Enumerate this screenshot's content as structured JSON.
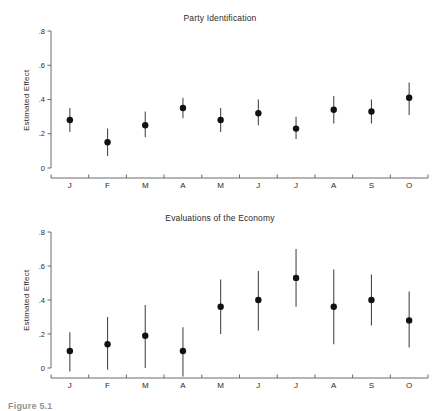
{
  "figure": {
    "caption": "Figure 5.1",
    "background": "#ffffff",
    "point_color": "#111111",
    "axis_color": "#5a5a5a"
  },
  "chart_data": [
    {
      "type": "scatter",
      "title": "Party Identification",
      "xlabel": "",
      "ylabel": "Estimated Effect",
      "categories": [
        "J",
        "F",
        "M",
        "A",
        "M",
        "J",
        "J",
        "A",
        "S",
        "O"
      ],
      "values": [
        0.28,
        0.15,
        0.25,
        0.35,
        0.28,
        0.32,
        0.23,
        0.34,
        0.33,
        0.41
      ],
      "ci_lower": [
        0.21,
        0.07,
        0.18,
        0.29,
        0.21,
        0.25,
        0.17,
        0.26,
        0.26,
        0.31
      ],
      "ci_upper": [
        0.35,
        0.23,
        0.33,
        0.41,
        0.35,
        0.4,
        0.3,
        0.42,
        0.4,
        0.5
      ],
      "ylim": [
        0,
        0.8
      ],
      "yticks": [
        0,
        0.2,
        0.4,
        0.6,
        0.8
      ],
      "ytick_labels": [
        "0",
        ".2",
        ".4",
        ".6",
        ".8"
      ],
      "grid": false,
      "legend": "none"
    },
    {
      "type": "scatter",
      "title": "Evaluations of the Economy",
      "xlabel": "",
      "ylabel": "Estimated Effect",
      "categories": [
        "J",
        "F",
        "M",
        "A",
        "M",
        "J",
        "J",
        "A",
        "S",
        "O"
      ],
      "values": [
        0.1,
        0.14,
        0.19,
        0.1,
        0.36,
        0.4,
        0.53,
        0.36,
        0.4,
        0.28
      ],
      "ci_lower": [
        -0.02,
        -0.01,
        0.0,
        -0.05,
        0.2,
        0.22,
        0.36,
        0.14,
        0.25,
        0.12
      ],
      "ci_upper": [
        0.21,
        0.3,
        0.37,
        0.24,
        0.52,
        0.57,
        0.7,
        0.58,
        0.55,
        0.45
      ],
      "ylim": [
        0,
        0.8
      ],
      "yticks": [
        0,
        0.2,
        0.4,
        0.6,
        0.8
      ],
      "ytick_labels": [
        "0",
        ".2",
        ".4",
        ".6",
        ".8"
      ],
      "grid": false,
      "legend": "none"
    }
  ]
}
